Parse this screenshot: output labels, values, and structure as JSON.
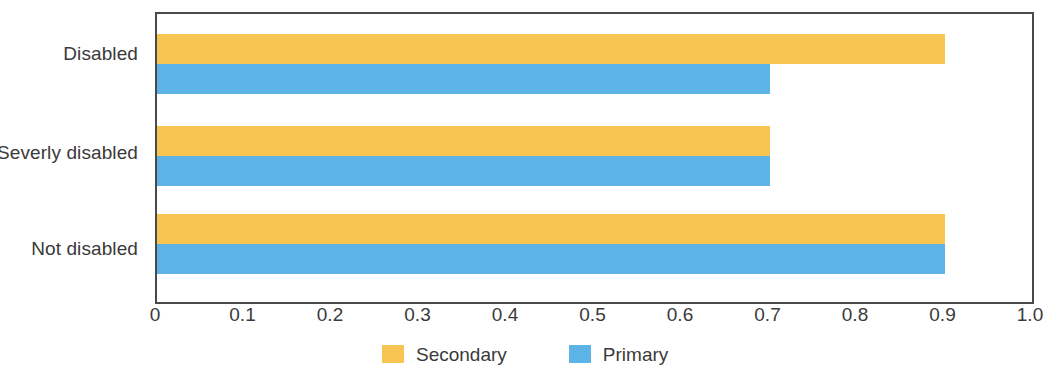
{
  "chart_data": {
    "type": "bar",
    "orientation": "horizontal",
    "title": "",
    "subtitle": "",
    "xlabel": "",
    "ylabel": "",
    "xlim": [
      0,
      1.0
    ],
    "grid": false,
    "legend_position": "bottom",
    "categories": [
      "Disabled",
      "Severly disabled",
      "Not disabled"
    ],
    "series": [
      {
        "name": "Secondary",
        "color": "#F9C552",
        "values": [
          0.9,
          0.7,
          0.9
        ]
      },
      {
        "name": "Primary",
        "color": "#5BB4E5",
        "values": [
          0.7,
          0.7,
          0.9
        ]
      }
    ],
    "x_ticks": [
      "0",
      "0.1",
      "0.2",
      "0.3",
      "0.4",
      "0.5",
      "0.6",
      "0.7",
      "0.8",
      "0.9",
      "1.0"
    ],
    "x_tick_values": [
      0,
      0.1,
      0.2,
      0.3,
      0.4,
      0.5,
      0.6,
      0.7,
      0.8,
      0.9,
      1.0
    ]
  },
  "axis": {
    "category_labels": [
      "Disabled",
      "Severly disabled",
      "Not disabled"
    ],
    "tick_labels": [
      "0",
      "0.1",
      "0.2",
      "0.3",
      "0.4",
      "0.5",
      "0.6",
      "0.7",
      "0.8",
      "0.9",
      "1.0"
    ]
  },
  "legend": {
    "items": [
      {
        "label": "Secondary",
        "color": "#F9C552"
      },
      {
        "label": "Primary",
        "color": "#5BB4E5"
      }
    ]
  },
  "colors": {
    "secondary": "#F9C552",
    "primary": "#5BB4E5",
    "axis": "#4a4a4a",
    "text": "#3a3a3a",
    "background": "#ffffff"
  }
}
